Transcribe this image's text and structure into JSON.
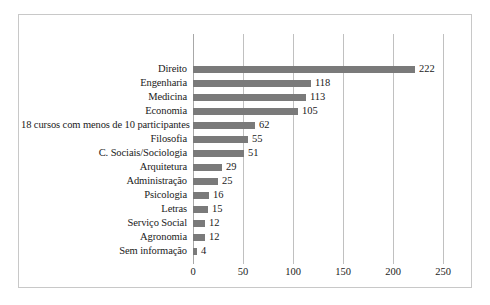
{
  "chart_data": {
    "type": "bar",
    "orientation": "horizontal",
    "title": "",
    "subtitle": "",
    "xlabel": "",
    "ylabel": "",
    "xlim": [
      0,
      250
    ],
    "ylim": null,
    "grid": true,
    "legend": null,
    "legend_position": "none",
    "xticks": [
      "0",
      "50",
      "100",
      "150",
      "200",
      "250"
    ],
    "xtick_values": [
      0,
      50,
      100,
      150,
      200,
      250
    ],
    "categories": [
      "Direito",
      "Engenharia",
      "Medicina",
      "Economia",
      "18 cursos com menos de 10 participantes",
      "Filosofia",
      "C. Sociais/Sociologia",
      "Arquitetura",
      "Administração",
      "Psicologia",
      "Letras",
      "Serviço Social",
      "Agronomia",
      "Sem informação"
    ],
    "values": [
      222,
      118,
      113,
      105,
      62,
      55,
      51,
      29,
      25,
      16,
      15,
      12,
      12,
      4
    ],
    "data_labels": [
      "222",
      "118",
      "113",
      "105",
      "62",
      "55",
      "51",
      "29",
      "25",
      "16",
      "15",
      "12",
      "12",
      "4"
    ],
    "bar_color": "#7a7a7a",
    "gridline_color": "#c0c0c0",
    "frame_color": "#c8c8c8",
    "background_color": "#ffffff"
  }
}
